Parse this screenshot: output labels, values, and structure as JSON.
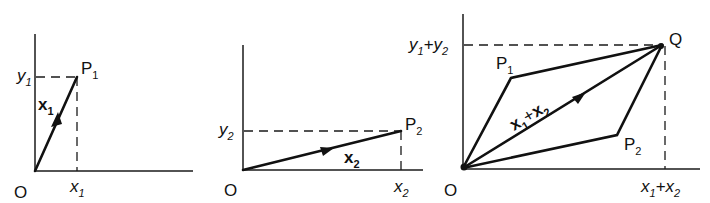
{
  "figure": {
    "panels": [
      {
        "id": "panel-1",
        "origin_label": "O",
        "point_label": "P",
        "point_sub": "1",
        "vector_label": "x",
        "vector_sub": "1",
        "x_label": "x",
        "x_sub": "1",
        "y_label": "y",
        "y_sub": "1"
      },
      {
        "id": "panel-2",
        "origin_label": "O",
        "point_label": "P",
        "point_sub": "2",
        "vector_label": "x",
        "vector_sub": "2",
        "x_label": "x",
        "x_sub": "2",
        "y_label": "y",
        "y_sub": "2"
      },
      {
        "id": "panel-3",
        "origin_label": "O",
        "q_label": "Q",
        "p1_label": "P",
        "p1_sub": "1",
        "p2_label": "P",
        "p2_sub": "2",
        "sum_vec_a": "x",
        "sum_vec_a_sub": "1",
        "sum_plus": "+",
        "sum_vec_b": "x",
        "sum_vec_b_sub": "2",
        "x_a": "x",
        "x_a_sub": "1",
        "x_plus": "+",
        "x_b": "x",
        "x_b_sub": "2",
        "y_a": "y",
        "y_a_sub": "1",
        "y_plus": "+",
        "y_b": "y",
        "y_b_sub": "2"
      }
    ]
  }
}
